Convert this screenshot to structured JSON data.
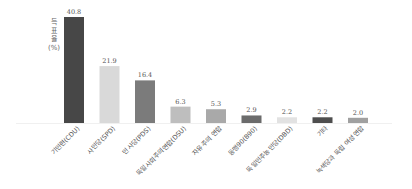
{
  "chart_data": {
    "type": "bar",
    "title": "",
    "xlabel": "",
    "ylabel": "득표율 (%)",
    "ylabel_lines": [
      "득",
      "표",
      "율",
      "(%)"
    ],
    "ylim": [
      0,
      45
    ],
    "grid": false,
    "legend": "none",
    "categories": [
      "기민련(CDU)",
      "사민당(SPD)",
      "민사당(PDS)",
      "독일사회주의연합(DSU)",
      "자유주의 연합",
      "동맹90(B90)",
      "독일민주농민당(DBD)",
      "기타",
      "녹색당과 독립 여성연합"
    ],
    "values": [
      40.8,
      21.9,
      16.4,
      6.3,
      5.3,
      2.9,
      2.2,
      2.2,
      2.0
    ],
    "value_labels": [
      "40.8",
      "21.9",
      "16.4",
      "6.3",
      "5.3",
      "2.9",
      "2.2",
      "2.2",
      "2.0"
    ],
    "colors": [
      "#474747",
      "#d9d9d9",
      "#7b7b7b",
      "#bebebe",
      "#a9a9a9",
      "#6b6b6b",
      "#e2e2e2",
      "#4e4e4e",
      "#a0a0a0"
    ]
  }
}
